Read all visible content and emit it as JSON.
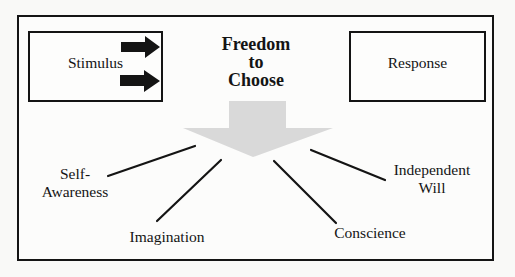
{
  "diagram": {
    "title": {
      "lines": [
        "Freedom",
        "to",
        "Choose"
      ]
    },
    "boxes": {
      "stimulus": "Stimulus",
      "response": "Response"
    },
    "factors": {
      "self_awareness": [
        "Self-",
        "Awareness"
      ],
      "imagination": "Imagination",
      "conscience": "Conscience",
      "independent_will": [
        "Independent",
        "Will"
      ]
    },
    "colors": {
      "stroke": "#141414",
      "arrow_fill": "#d9d9d9",
      "background": "#fcfcfb"
    }
  }
}
